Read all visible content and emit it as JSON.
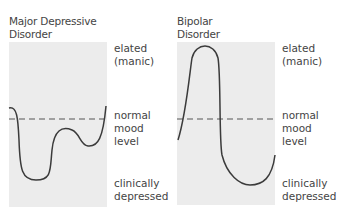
{
  "panels": [
    {
      "title_line1": "Major Depressive",
      "title_line2": "Disorder",
      "labels": {
        "elated_1": "elated",
        "elated_2": "(manic)",
        "normal_1": "normal",
        "normal_2": "mood",
        "normal_3": "level",
        "depressed_1": "clinically",
        "depressed_2": "depressed"
      }
    },
    {
      "title_line1": "Bipolar",
      "title_line2": "Disorder",
      "labels": {
        "elated_1": "elated",
        "elated_2": "(manic)",
        "normal_1": "normal",
        "normal_2": "mood",
        "normal_3": "level",
        "depressed_1": "clinically",
        "depressed_2": "depressed"
      }
    }
  ],
  "colors": {
    "panel_bg": "#ececec",
    "curve": "#3b3b3b",
    "dashed_line": "#555555"
  }
}
